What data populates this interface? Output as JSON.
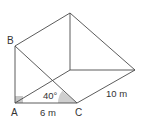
{
  "figure": {
    "type": "triangular-prism",
    "vertices": {
      "B": {
        "label": "B"
      },
      "A": {
        "label": "A"
      },
      "C": {
        "label": "C"
      }
    },
    "measurements": {
      "AC": "6 m",
      "depth": "10 m",
      "angle_C": "40°"
    },
    "marks": {
      "right_angle_at": "A",
      "angle_marked_at": "C"
    },
    "colors": {
      "edge": "#4a4a4a",
      "right_angle_fill": "#c8c8c8",
      "angle_fill": "#cfcfcf"
    }
  }
}
